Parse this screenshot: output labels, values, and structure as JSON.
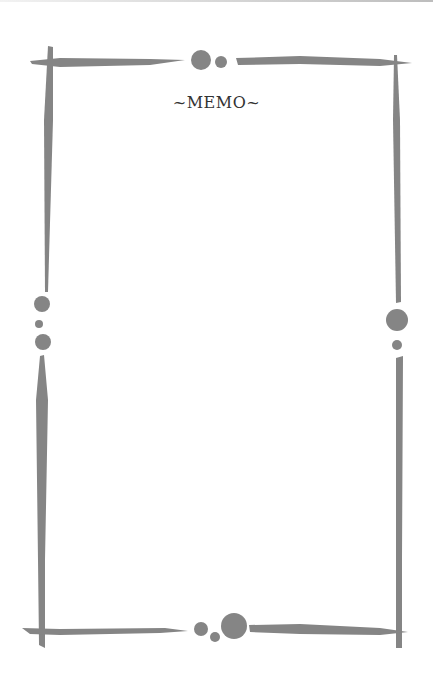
{
  "memo": {
    "title": "~MEMO~",
    "frame_color": "#808080"
  }
}
